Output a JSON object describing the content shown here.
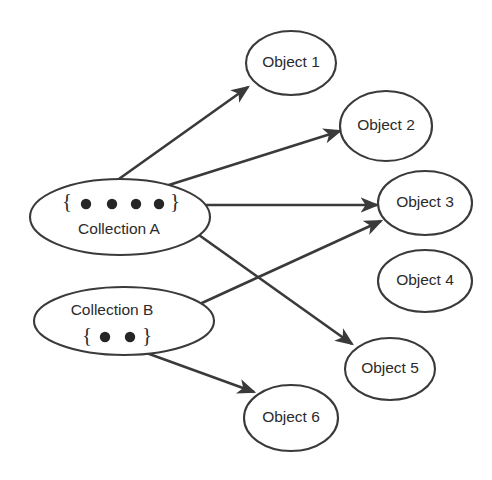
{
  "diagram": {
    "type": "object-reference-diagram",
    "background_color": "#ffffff",
    "stroke_color": "#3a3a3a",
    "dot_color": "#262626",
    "text_color": "#2b2b2b",
    "collections": [
      {
        "id": "collection-a",
        "label": "Collection A",
        "open_brace": "{",
        "close_brace": "}",
        "ellipse": {
          "cx": 120,
          "cy": 217,
          "rx": 90,
          "ry": 38
        },
        "label_pos": {
          "x": 119,
          "y": 230
        },
        "brace_open_pos": {
          "x": 67,
          "y": 203
        },
        "brace_close_pos": {
          "x": 175,
          "y": 203
        },
        "dots": [
          {
            "id": "a-dot-1",
            "cx": 86,
            "cy": 204,
            "r": 5.2
          },
          {
            "id": "a-dot-2",
            "cx": 112,
            "cy": 204,
            "r": 5.2
          },
          {
            "id": "a-dot-3",
            "cx": 136,
            "cy": 204,
            "r": 5.2
          },
          {
            "id": "a-dot-4",
            "cx": 159,
            "cy": 204,
            "r": 5.2
          }
        ]
      },
      {
        "id": "collection-b",
        "label": "Collection B",
        "open_brace": "{",
        "close_brace": "}",
        "ellipse": {
          "cx": 124,
          "cy": 321,
          "rx": 90,
          "ry": 34
        },
        "label_pos": {
          "x": 112,
          "y": 311
        },
        "brace_open_pos": {
          "x": 87,
          "y": 337
        },
        "brace_close_pos": {
          "x": 147,
          "y": 337
        },
        "dots": [
          {
            "id": "b-dot-1",
            "cx": 105,
            "cy": 337,
            "r": 5.2
          },
          {
            "id": "b-dot-2",
            "cx": 130,
            "cy": 337,
            "r": 5.2
          }
        ]
      }
    ],
    "objects": [
      {
        "id": "object-1",
        "label": "Object 1",
        "ellipse": {
          "cx": 291,
          "cy": 63,
          "rx": 45,
          "ry": 32
        }
      },
      {
        "id": "object-2",
        "label": "Object 2",
        "ellipse": {
          "cx": 386,
          "cy": 126,
          "rx": 46,
          "ry": 35
        }
      },
      {
        "id": "object-3",
        "label": "Object 3",
        "ellipse": {
          "cx": 425,
          "cy": 203,
          "rx": 47,
          "ry": 32
        }
      },
      {
        "id": "object-4",
        "label": "Object 4",
        "ellipse": {
          "cx": 425,
          "cy": 281,
          "rx": 47,
          "ry": 31
        }
      },
      {
        "id": "object-5",
        "label": "Object 5",
        "ellipse": {
          "cx": 390,
          "cy": 369,
          "rx": 45,
          "ry": 31
        }
      },
      {
        "id": "object-6",
        "label": "Object 6",
        "ellipse": {
          "cx": 291,
          "cy": 418,
          "rx": 47,
          "ry": 33
        }
      }
    ],
    "references": [
      {
        "id": "ref-a1-object1",
        "from": "a-dot-1",
        "to": "object-1",
        "x1": 88,
        "y1": 201,
        "x2": 248,
        "y2": 87
      },
      {
        "id": "ref-a2-object2",
        "from": "a-dot-2",
        "to": "object-2",
        "x1": 115,
        "y1": 202,
        "x2": 340,
        "y2": 131
      },
      {
        "id": "ref-a3-object3",
        "from": "a-dot-3",
        "to": "object-3",
        "x1": 138,
        "y1": 205,
        "x2": 377,
        "y2": 205
      },
      {
        "id": "ref-a4-object5",
        "from": "a-dot-4",
        "to": "object-5",
        "x1": 161,
        "y1": 208,
        "x2": 352,
        "y2": 344
      },
      {
        "id": "ref-b1-object6",
        "from": "b-dot-1",
        "to": "object-6",
        "x1": 108,
        "y1": 339,
        "x2": 254,
        "y2": 392
      },
      {
        "id": "ref-b2-object3",
        "from": "b-dot-2",
        "to": "object-3",
        "x1": 132,
        "y1": 335,
        "x2": 381,
        "y2": 221
      }
    ]
  }
}
